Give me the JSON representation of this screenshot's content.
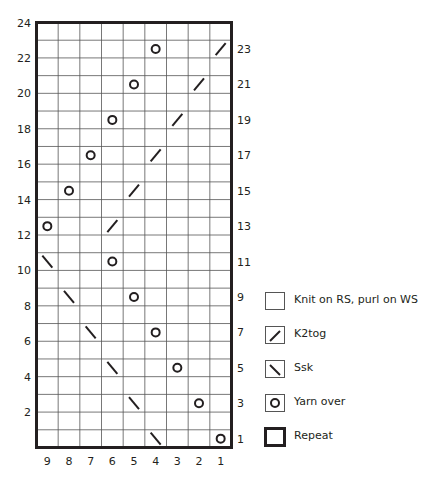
{
  "chart_data": {
    "type": "knitting-chart",
    "title": "",
    "columns": 9,
    "rows": 24,
    "column_labels": [
      "9",
      "8",
      "7",
      "6",
      "5",
      "4",
      "3",
      "2",
      "1"
    ],
    "left_row_labels": [
      "24",
      "22",
      "20",
      "18",
      "16",
      "14",
      "12",
      "10",
      "8",
      "6",
      "4",
      "2"
    ],
    "right_row_labels": [
      "23",
      "21",
      "19",
      "17",
      "15",
      "13",
      "11",
      "9",
      "7",
      "5",
      "3",
      "1"
    ],
    "stitch_order_note": "columns numbered right-to-left (col 1 at right)",
    "symbols": [
      {
        "row": 1,
        "col": 1,
        "symbol": "yarn-over"
      },
      {
        "row": 1,
        "col": 4,
        "symbol": "ssk"
      },
      {
        "row": 3,
        "col": 2,
        "symbol": "yarn-over"
      },
      {
        "row": 3,
        "col": 5,
        "symbol": "ssk"
      },
      {
        "row": 5,
        "col": 3,
        "symbol": "yarn-over"
      },
      {
        "row": 5,
        "col": 6,
        "symbol": "ssk"
      },
      {
        "row": 7,
        "col": 4,
        "symbol": "yarn-over"
      },
      {
        "row": 7,
        "col": 7,
        "symbol": "ssk"
      },
      {
        "row": 9,
        "col": 5,
        "symbol": "yarn-over"
      },
      {
        "row": 9,
        "col": 8,
        "symbol": "ssk"
      },
      {
        "row": 11,
        "col": 6,
        "symbol": "yarn-over"
      },
      {
        "row": 11,
        "col": 9,
        "symbol": "ssk"
      },
      {
        "row": 13,
        "col": 9,
        "symbol": "yarn-over"
      },
      {
        "row": 13,
        "col": 6,
        "symbol": "k2tog"
      },
      {
        "row": 15,
        "col": 8,
        "symbol": "yarn-over"
      },
      {
        "row": 15,
        "col": 5,
        "symbol": "k2tog"
      },
      {
        "row": 17,
        "col": 7,
        "symbol": "yarn-over"
      },
      {
        "row": 17,
        "col": 4,
        "symbol": "k2tog"
      },
      {
        "row": 19,
        "col": 6,
        "symbol": "yarn-over"
      },
      {
        "row": 19,
        "col": 3,
        "symbol": "k2tog"
      },
      {
        "row": 21,
        "col": 5,
        "symbol": "yarn-over"
      },
      {
        "row": 21,
        "col": 2,
        "symbol": "k2tog"
      },
      {
        "row": 23,
        "col": 4,
        "symbol": "yarn-over"
      },
      {
        "row": 23,
        "col": 1,
        "symbol": "k2tog"
      }
    ],
    "repeat_outline": {
      "cols": [
        1,
        9
      ],
      "rows": [
        1,
        24
      ]
    }
  },
  "legend": {
    "items": [
      {
        "symbol": "knit",
        "label": "Knit on RS, purl on WS"
      },
      {
        "symbol": "k2tog",
        "label": "K2tog"
      },
      {
        "symbol": "ssk",
        "label": "Ssk"
      },
      {
        "symbol": "yarn-over",
        "label": "Yarn over"
      },
      {
        "symbol": "repeat",
        "label": "Repeat"
      }
    ]
  },
  "colors": {
    "ink": "#231f20",
    "grid": "#555555",
    "background": "#ffffff"
  }
}
